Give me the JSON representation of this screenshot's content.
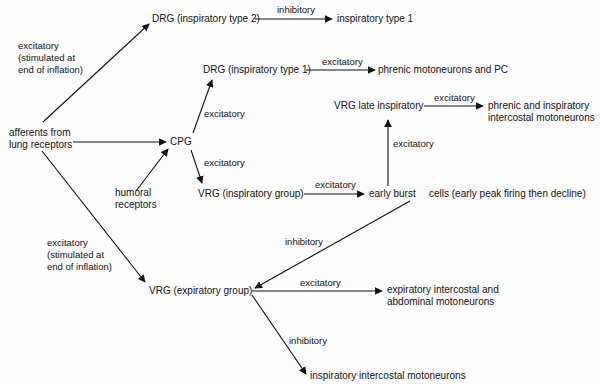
{
  "nodes": {
    "afferents": [
      "afferents from",
      "lung receptors"
    ],
    "humoral": [
      "humoral",
      "receptors"
    ],
    "cpg": "CPG",
    "drg_type2": "DRG (inspiratory type 2)",
    "insp_type1": "inspiratory type 1",
    "drg_type1": "DRG (inspiratory type 1)",
    "phrenic_pc": "phrenic motoneurons and PC",
    "vrg_late": "VRG late inspiratory",
    "phrenic_intercostal": [
      "phrenic and inspiratory",
      "intercostal motoneurons"
    ],
    "vrg_insp": "VRG (inspiratory group)",
    "early_burst": "early burst",
    "early_burst_note": "cells (early peak firing then decline)",
    "vrg_exp": "VRG (expiratory group)",
    "exp_motoneurons": [
      "expiratory intercostal and",
      "abdominal motoneurons"
    ],
    "insp_intercostal": "inspiratory intercostal motoneurons"
  },
  "edge_labels": {
    "aff_to_drg2": [
      "excitatory",
      "(stimulated at",
      "end of inflation)"
    ],
    "drg2_to_type1": "inhibitory",
    "cpg_to_drg1": "excitatory",
    "drg1_to_phrenic": "excitatory",
    "vrglate_to_phrenic": "excitatory",
    "early_to_vrglate": "excitatory",
    "cpg_to_vrginsp": "excitatory",
    "vrginsp_to_early": "excitatory",
    "early_to_vrgexp": "inhibitory",
    "aff_to_vrgexp": [
      "excitatory",
      "(stimulated at",
      "end of inflation)"
    ],
    "vrgexp_to_expmoto": "excitatory",
    "vrgexp_to_inspmoto": "inhibitory"
  }
}
